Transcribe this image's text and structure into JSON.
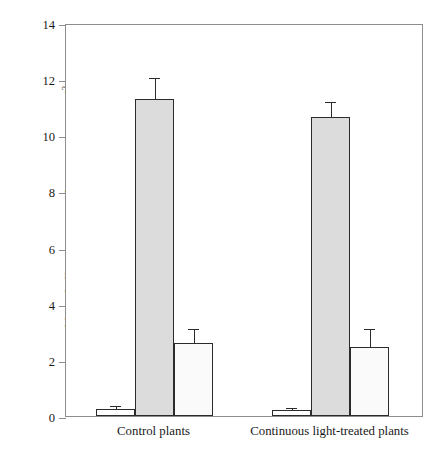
{
  "chart_data": {
    "type": "bar",
    "title": "",
    "xlabel": "",
    "ylabel": "Chlorophyll, protein or Rubisco content (g m",
    "ylabel_superscript": "-2",
    "ylabel_suffix": ")",
    "ylim": [
      0,
      14
    ],
    "ytick_step": 2,
    "yticks": [
      "0",
      "2",
      "4",
      "6",
      "8",
      "10",
      "12",
      "14"
    ],
    "grid": false,
    "legend": "none",
    "categories": [
      "Control plants",
      "Continuous light-treated plants"
    ],
    "series": [
      {
        "name": "Chlorophyll",
        "fill": "#ffffff",
        "values": [
          0.25,
          0.2
        ],
        "errors": [
          0.08,
          0.06
        ]
      },
      {
        "name": "Protein",
        "fill": "#dcdcdc",
        "values": [
          11.3,
          10.65
        ],
        "errors": [
          0.7,
          0.5
        ]
      },
      {
        "name": "Rubisco",
        "fill": "#fafafa",
        "values": [
          2.6,
          2.45
        ],
        "errors": [
          0.45,
          0.6
        ]
      }
    ]
  },
  "colors": {
    "axis": "#8d8d8d",
    "bar_outline": "#2b2b2b",
    "gray_fill": "#dcdcdc",
    "white_fill": "#ffffff",
    "offwhite_fill": "#fafafa",
    "text": "#1a1a1a"
  }
}
